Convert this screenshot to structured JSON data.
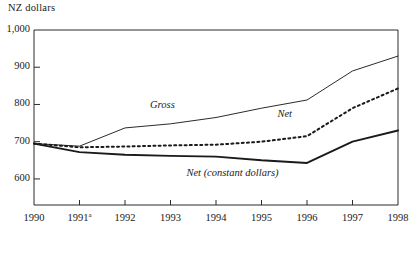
{
  "chart_data": {
    "type": "line",
    "title": "",
    "subtitle": "",
    "ylabel": "NZ dollars",
    "xlabel": "",
    "ylim": [
      550,
      1000
    ],
    "yticks": [
      1000,
      900,
      800,
      700,
      600
    ],
    "ytick_labels": [
      "1,000",
      "900",
      "800",
      "700",
      "600"
    ],
    "x": [
      1990,
      1991,
      1992,
      1993,
      1994,
      1995,
      1996,
      1997,
      1998
    ],
    "xtick_labels": [
      "1990",
      "1991",
      "1992",
      "1993",
      "1994",
      "1995",
      "1996",
      "1997",
      "1998"
    ],
    "xtick_footnote_index": 1,
    "xtick_footnote_marker": "a",
    "grid": false,
    "legend_position": "inline-annotations",
    "series": [
      {
        "name": "Gross",
        "label": "Gross",
        "style": "solid-thin",
        "color": "#2b2b2b",
        "values": [
          695,
          688,
          737,
          748,
          765,
          790,
          812,
          890,
          930
        ],
        "label_x": 1992.55,
        "label_y": 795
      },
      {
        "name": "Net",
        "label": "Net",
        "style": "dotted",
        "color": "#1a1a1a",
        "values": [
          695,
          685,
          687,
          690,
          692,
          700,
          715,
          790,
          843
        ],
        "label_x": 1995.35,
        "label_y": 772
      },
      {
        "name": "Net (constant dollars)",
        "label": "Net (constant dollars)",
        "style": "solid-thick",
        "color": "#1a1a1a",
        "values": [
          695,
          672,
          665,
          662,
          660,
          650,
          643,
          700,
          730
        ],
        "label_x": 1993.35,
        "label_y": 612
      }
    ]
  },
  "plot_geometry": {
    "left": 34,
    "right": 398,
    "top": 30,
    "bottom": 205,
    "y_value_at_top": 1000,
    "y_value_at_bottom": 530
  }
}
